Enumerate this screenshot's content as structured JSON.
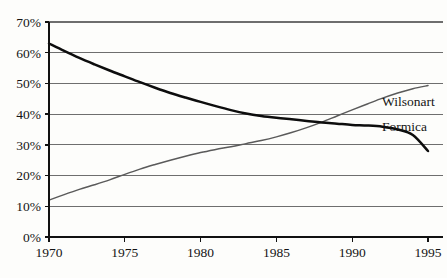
{
  "chart_data": {
    "type": "line",
    "title": "",
    "subtitle": "",
    "xlabel": "",
    "ylabel": "",
    "xlim": [
      1970,
      1995
    ],
    "ylim": [
      0,
      70
    ],
    "grid": true,
    "legend_position": "line-end-labels",
    "x_tick_labels": [
      "1970",
      "1975",
      "1980",
      "1985",
      "1990",
      "1995"
    ],
    "x_ticks": [
      1970,
      1975,
      1980,
      1985,
      1990,
      1995
    ],
    "y_tick_labels": [
      "0%",
      "10%",
      "20%",
      "30%",
      "40%",
      "50%",
      "60%",
      "70%"
    ],
    "y_ticks": [
      0,
      10,
      20,
      30,
      40,
      50,
      60,
      70
    ],
    "x": [
      1970,
      1971,
      1972,
      1973,
      1974,
      1975,
      1976,
      1977,
      1978,
      1979,
      1980,
      1981,
      1982,
      1983,
      1984,
      1985,
      1986,
      1987,
      1988,
      1989,
      1990,
      1991,
      1992,
      1993,
      1994,
      1995
    ],
    "series": [
      {
        "name": "Formica",
        "color": "#0d0d0d",
        "style": "thick-black",
        "label_x": 1995,
        "label_y": 36,
        "values": [
          63.0,
          60.6,
          58.3,
          56.2,
          54.2,
          52.3,
          50.4,
          48.6,
          46.9,
          45.4,
          44.0,
          42.6,
          41.3,
          40.2,
          39.4,
          38.8,
          38.3,
          37.8,
          37.3,
          36.9,
          36.5,
          36.3,
          35.9,
          35.0,
          33.2,
          28.0
        ]
      },
      {
        "name": "Wilsonart",
        "color": "#5a5a5a",
        "style": "thin-gray",
        "label_x": 1995,
        "label_y": 44,
        "values": [
          12.0,
          13.8,
          15.5,
          17.0,
          18.6,
          20.4,
          22.1,
          23.6,
          25.0,
          26.3,
          27.5,
          28.5,
          29.4,
          30.4,
          31.4,
          32.6,
          34.0,
          35.6,
          37.4,
          39.4,
          41.4,
          43.3,
          45.2,
          46.9,
          48.3,
          49.3
        ]
      }
    ]
  },
  "plot": {
    "formica_label": "Formica",
    "wilsonart_label": "Wilsonart"
  }
}
